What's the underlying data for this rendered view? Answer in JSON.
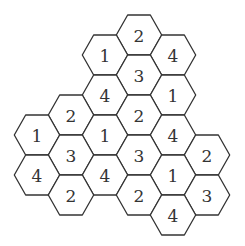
{
  "puzzle": {
    "type": "hexagon-number-grid",
    "line_color": "#333333",
    "cells": [
      {
        "id": "c1",
        "value": "2",
        "cx": 139,
        "cy": 35
      },
      {
        "id": "c2",
        "value": "1",
        "cx": 105,
        "cy": 55
      },
      {
        "id": "c3",
        "value": "4",
        "cx": 173,
        "cy": 55
      },
      {
        "id": "c4",
        "value": "3",
        "cx": 139,
        "cy": 75
      },
      {
        "id": "c5",
        "value": "4",
        "cx": 105,
        "cy": 95
      },
      {
        "id": "c6",
        "value": "1",
        "cx": 173,
        "cy": 95
      },
      {
        "id": "c7",
        "value": "2",
        "cx": 71,
        "cy": 115
      },
      {
        "id": "c8",
        "value": "2",
        "cx": 139,
        "cy": 115
      },
      {
        "id": "c9",
        "value": "1",
        "cx": 37,
        "cy": 135
      },
      {
        "id": "c10",
        "value": "1",
        "cx": 105,
        "cy": 135
      },
      {
        "id": "c11",
        "value": "4",
        "cx": 173,
        "cy": 135
      },
      {
        "id": "c12",
        "value": "3",
        "cx": 71,
        "cy": 155
      },
      {
        "id": "c13",
        "value": "3",
        "cx": 139,
        "cy": 155
      },
      {
        "id": "c14",
        "value": "2",
        "cx": 207,
        "cy": 155
      },
      {
        "id": "c15",
        "value": "4",
        "cx": 37,
        "cy": 175
      },
      {
        "id": "c16",
        "value": "4",
        "cx": 105,
        "cy": 175
      },
      {
        "id": "c17",
        "value": "1",
        "cx": 173,
        "cy": 175
      },
      {
        "id": "c18",
        "value": "2",
        "cx": 71,
        "cy": 195
      },
      {
        "id": "c19",
        "value": "2",
        "cx": 139,
        "cy": 195
      },
      {
        "id": "c20",
        "value": "3",
        "cx": 207,
        "cy": 195
      },
      {
        "id": "c21",
        "value": "4",
        "cx": 173,
        "cy": 215
      }
    ]
  }
}
